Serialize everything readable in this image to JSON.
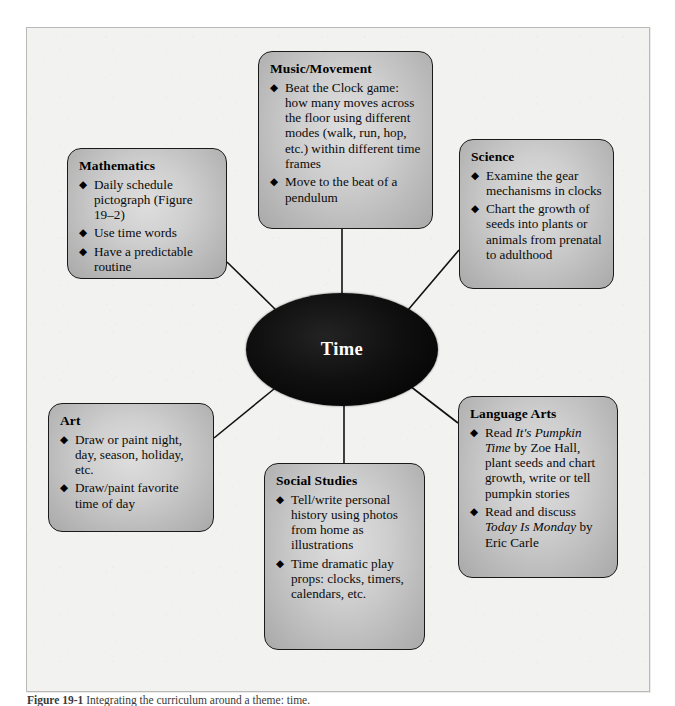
{
  "figure": {
    "center": {
      "label": "Time"
    },
    "caption_number": "Figure 19-1",
    "caption_text": "Integrating the curriculum around a theme: time.",
    "colors": {
      "page_background": "#ffffff",
      "frame_background": "#f2f2f0",
      "frame_border": "#b9b9b7",
      "box_fill_light": "#dedede",
      "box_fill_dark": "#a9a9a9",
      "box_border": "#1a1a1a",
      "center_fill": "#000000",
      "center_text": "#ffffff",
      "connector": "#111111"
    },
    "bullet_glyph": "◆",
    "bullet_icon_name": "diamond-bullet-icon"
  },
  "nodes": [
    {
      "id": "mathematics",
      "title": "Mathematics",
      "items": [
        {
          "text": "Daily schedule pictograph (Figure 19–2)"
        },
        {
          "text": "Use time words"
        },
        {
          "text": "Have a predictable routine"
        }
      ]
    },
    {
      "id": "music",
      "title": "Music/Movement",
      "items": [
        {
          "text": "Beat the Clock game: how many moves across the floor using different modes (walk, run, hop, etc.) within different time frames"
        },
        {
          "text": "Move to the beat of a pendulum"
        }
      ]
    },
    {
      "id": "science",
      "title": "Science",
      "items": [
        {
          "text": "Examine the gear mechanisms in clocks"
        },
        {
          "text": "Chart the growth of seeds into plants or animals from prenatal to adulthood"
        }
      ]
    },
    {
      "id": "art",
      "title": "Art",
      "items": [
        {
          "text": "Draw or paint night, day, season, holiday, etc."
        },
        {
          "text": "Draw/paint favorite time of day"
        }
      ]
    },
    {
      "id": "social",
      "title": "Social Studies",
      "items": [
        {
          "text": "Tell/write personal history using photos from home as illustrations"
        },
        {
          "text": "Time dramatic play props: clocks, timers, calendars, etc."
        }
      ]
    },
    {
      "id": "language",
      "title": "Language Arts",
      "items": [
        {
          "html": "Read <i>It's Pumpkin Time</i> by Zoe Hall, plant seeds and chart growth, write or tell pumpkin stories"
        },
        {
          "html": "Read and discuss <i>Today Is Monday</i> by Eric Carle"
        }
      ]
    }
  ]
}
